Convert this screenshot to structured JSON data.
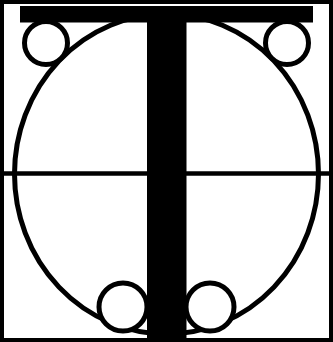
{
  "artwork": {
    "title": "Letter T monogram emblem",
    "description": "Black-and-white geometric construction drawing of a capital letter T inside a square frame, overlaid on a large ellipse with four small tangent circles at the corners and a thin horizontal axis line.",
    "alt_text": "Stylized capital letter T logo built from a square border, an inscribed ellipse, four small circles and a horizontal median line, rendered in solid black on white.",
    "letter": "T",
    "background_color": "#ffffff",
    "ink_color": "#000000",
    "canvas": {
      "width": 333,
      "height": 342
    }
  },
  "geometry": {
    "frame": {
      "name": "outer-square-frame",
      "x": 2.0,
      "y": 2.0,
      "width": 329.0,
      "height": 338.0,
      "stroke_width": 4.0,
      "fill": "none"
    },
    "t_letter": {
      "name": "letter-t-solid",
      "arm_top": 6.0,
      "arm_bottom": 22.5,
      "arm_left": 20.0,
      "arm_right": 313.0,
      "stem_left": 147.0,
      "stem_right": 186.5,
      "stem_top": 6.0,
      "stem_bottom": 338.0,
      "fill": "#000000"
    },
    "ellipse": {
      "name": "construction-ellipse",
      "cx": 166.5,
      "cy": 174.0,
      "rx": 152.0,
      "ry": 160.0,
      "stroke_width": 5.0,
      "fill": "none"
    },
    "median_line": {
      "name": "horizontal-median-line",
      "x1": 4.0,
      "x2": 329.0,
      "y": 173.5,
      "stroke_width": 4.5
    },
    "corner_circles": [
      {
        "name": "corner-circle-top-left",
        "cx": 46.0,
        "cy": 43.0,
        "r": 21.5,
        "stroke_width": 5.0
      },
      {
        "name": "corner-circle-top-right",
        "cx": 287.0,
        "cy": 43.0,
        "r": 21.5,
        "stroke_width": 5.0
      },
      {
        "name": "corner-circle-bottom-left",
        "cx": 123.0,
        "cy": 307.0,
        "r": 24.0,
        "stroke_width": 5.0
      },
      {
        "name": "corner-circle-bottom-right",
        "cx": 210.0,
        "cy": 307.0,
        "r": 24.0,
        "stroke_width": 5.0
      }
    ]
  }
}
